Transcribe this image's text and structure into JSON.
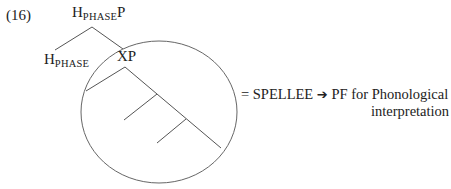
{
  "example_number": "(16)",
  "tree": {
    "root": {
      "head": "H",
      "sub": "PHASE",
      "suffix": "P"
    },
    "left_child": {
      "head": "H",
      "sub": "PHASE"
    },
    "right_child": {
      "label": "XP"
    }
  },
  "annotation": {
    "prefix": "= SPELLEE",
    "arrow": "➔",
    "line1_rest": "PF for Phonological",
    "line2": "interpretation"
  },
  "colors": {
    "line": "#555555",
    "text": "#222222",
    "background": "#ffffff"
  }
}
